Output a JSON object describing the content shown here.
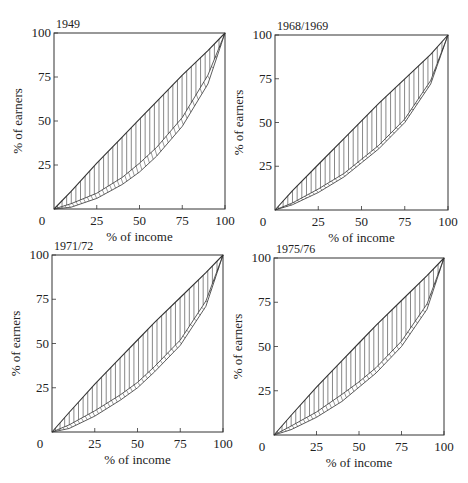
{
  "chart_data": [
    {
      "type": "line",
      "title": "1949",
      "xlabel": "% of income",
      "ylabel": "% of earners",
      "xlim": [
        0,
        100
      ],
      "ylim": [
        0,
        100
      ],
      "xticks": [
        "0",
        "25",
        "50",
        "75",
        "100"
      ],
      "yticks": [
        "25",
        "50",
        "75",
        "100"
      ],
      "grid": false,
      "series": [
        {
          "name": "upper curve",
          "x": [
            0,
            10,
            25,
            40,
            50,
            60,
            75,
            90,
            100
          ],
          "y": [
            0,
            10,
            26,
            41,
            51,
            61,
            76,
            90,
            100
          ]
        },
        {
          "name": "band upper",
          "x": [
            0,
            10,
            25,
            40,
            50,
            60,
            75,
            90,
            100
          ],
          "y": [
            0,
            3,
            9,
            18,
            26,
            35,
            52,
            76,
            100
          ]
        },
        {
          "name": "lower curve",
          "x": [
            0,
            10,
            25,
            40,
            50,
            60,
            75,
            90,
            100
          ],
          "y": [
            0,
            1,
            6,
            14,
            21,
            30,
            47,
            71,
            100
          ]
        }
      ]
    },
    {
      "type": "line",
      "title": "1968/1969",
      "xlabel": "% of income",
      "ylabel": "% of earners",
      "xlim": [
        0,
        100
      ],
      "ylim": [
        0,
        100
      ],
      "xticks": [
        "0",
        "25",
        "50",
        "75",
        "100"
      ],
      "yticks": [
        "25",
        "50",
        "75",
        "100"
      ],
      "grid": false,
      "series": [
        {
          "name": "upper curve",
          "x": [
            0,
            10,
            25,
            40,
            50,
            60,
            75,
            90,
            100
          ],
          "y": [
            0,
            11,
            26,
            41,
            51,
            61,
            75,
            89,
            100
          ]
        },
        {
          "name": "band upper",
          "x": [
            0,
            10,
            25,
            40,
            50,
            60,
            75,
            90,
            100
          ],
          "y": [
            0,
            4,
            12,
            21,
            29,
            37,
            52,
            74,
            100
          ]
        },
        {
          "name": "lower curve",
          "x": [
            0,
            10,
            25,
            40,
            50,
            60,
            75,
            90,
            100
          ],
          "y": [
            0,
            3,
            10,
            19,
            27,
            35,
            50,
            72,
            100
          ]
        }
      ]
    },
    {
      "type": "line",
      "title": "1971/72",
      "xlabel": "% of income",
      "ylabel": "% of earners",
      "xlim": [
        0,
        100
      ],
      "ylim": [
        0,
        100
      ],
      "xticks": [
        "0",
        "25",
        "50",
        "75",
        "100"
      ],
      "yticks": [
        "25",
        "50",
        "75",
        "100"
      ],
      "grid": false,
      "series": [
        {
          "name": "upper curve",
          "x": [
            0,
            10,
            25,
            40,
            50,
            60,
            75,
            90,
            100
          ],
          "y": [
            0,
            11,
            27,
            42,
            52,
            62,
            76,
            90,
            100
          ]
        },
        {
          "name": "band upper",
          "x": [
            0,
            10,
            25,
            40,
            50,
            60,
            75,
            90,
            100
          ],
          "y": [
            0,
            4,
            12,
            21,
            28,
            37,
            52,
            74,
            100
          ]
        },
        {
          "name": "lower curve",
          "x": [
            0,
            10,
            25,
            40,
            50,
            60,
            75,
            90,
            100
          ],
          "y": [
            0,
            2,
            9,
            18,
            25,
            34,
            49,
            71,
            100
          ]
        }
      ]
    },
    {
      "type": "line",
      "title": "1975/76",
      "xlabel": "% of income",
      "ylabel": "% of earners",
      "xlim": [
        0,
        100
      ],
      "ylim": [
        0,
        100
      ],
      "xticks": [
        "0",
        "25",
        "50",
        "75",
        "100"
      ],
      "yticks": [
        "25",
        "50",
        "75",
        "100"
      ],
      "grid": false,
      "series": [
        {
          "name": "upper curve",
          "x": [
            0,
            10,
            25,
            40,
            50,
            60,
            75,
            90,
            100
          ],
          "y": [
            0,
            11,
            27,
            42,
            52,
            62,
            76,
            90,
            100
          ]
        },
        {
          "name": "band upper",
          "x": [
            0,
            10,
            25,
            40,
            50,
            60,
            75,
            90,
            100
          ],
          "y": [
            0,
            5,
            13,
            23,
            30,
            38,
            53,
            74,
            100
          ]
        },
        {
          "name": "lower curve",
          "x": [
            0,
            10,
            25,
            40,
            50,
            60,
            75,
            90,
            100
          ],
          "y": [
            0,
            3,
            10,
            19,
            27,
            35,
            50,
            71,
            100
          ]
        }
      ]
    }
  ],
  "panels": [
    {
      "title": "1949",
      "xlabel": "% of income",
      "ylabel": "% of earners",
      "x0": "0",
      "xt": [
        "25",
        "50",
        "75",
        "100"
      ],
      "yt": [
        "25",
        "50",
        "75",
        "100"
      ]
    },
    {
      "title": "1968/1969",
      "xlabel": "% of income",
      "ylabel": "% of earners",
      "x0": "0",
      "xt": [
        "25",
        "50",
        "75",
        "100"
      ],
      "yt": [
        "25",
        "50",
        "75",
        "100"
      ]
    },
    {
      "title": "1971/72",
      "xlabel": "% of income",
      "ylabel": "% of earners",
      "x0": "0",
      "xt": [
        "25",
        "50",
        "75",
        "100"
      ],
      "yt": [
        "25",
        "50",
        "75",
        "100"
      ]
    },
    {
      "title": "1975/76",
      "xlabel": "% of income",
      "ylabel": "% of earners",
      "x0": "0",
      "xt": [
        "25",
        "50",
        "75",
        "100"
      ],
      "yt": [
        "25",
        "50",
        "75",
        "100"
      ]
    }
  ],
  "colors": {
    "line": "#333333",
    "hatch": "#555555",
    "background": "#ffffff"
  }
}
